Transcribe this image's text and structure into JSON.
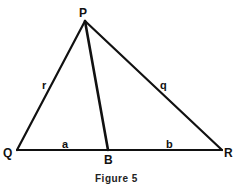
{
  "figure": {
    "caption": "Figure 5",
    "vertices": {
      "P": {
        "label": "P",
        "x": 85,
        "y": 21
      },
      "Q": {
        "label": "Q",
        "x": 17,
        "y": 150
      },
      "R": {
        "label": "R",
        "x": 222,
        "y": 150
      },
      "B": {
        "label": "B",
        "x": 108,
        "y": 150
      }
    },
    "sides": {
      "PQ": {
        "label": "r"
      },
      "PR": {
        "label": "q"
      },
      "QB": {
        "label": "a"
      },
      "BR": {
        "label": "b"
      }
    },
    "segments": [
      "PQ",
      "PR",
      "QR",
      "PB"
    ],
    "stroke_color": "#111111"
  }
}
